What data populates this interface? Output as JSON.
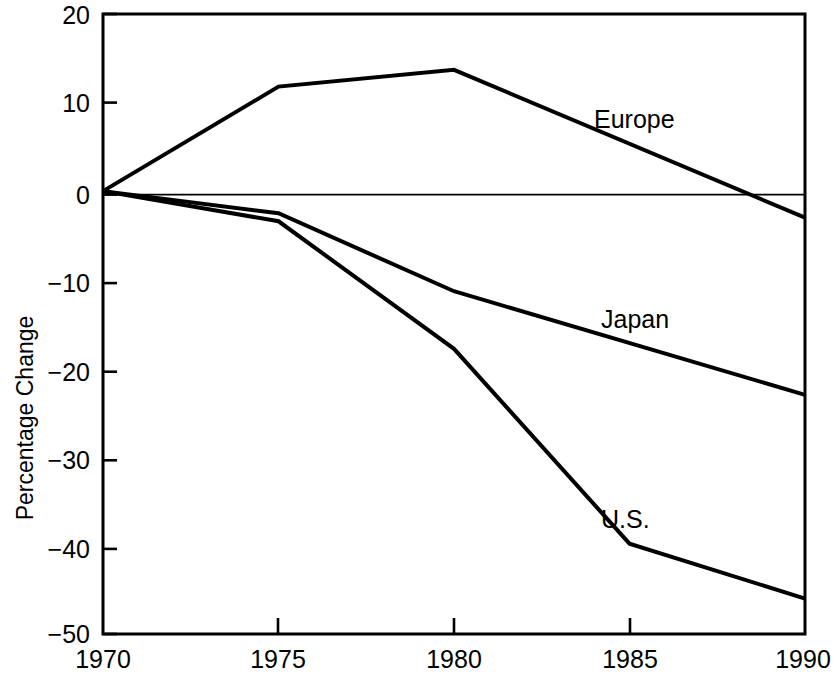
{
  "chart_data": {
    "type": "line",
    "title": "",
    "subtitle": "",
    "xlabel": "",
    "ylabel": "Percentage Change",
    "x": [
      1970,
      1975,
      1980,
      1985,
      1990
    ],
    "xticklabels": [
      "1970",
      "1975",
      "1980",
      "1985",
      "1990"
    ],
    "yticks": [
      20,
      10,
      0,
      -10,
      -20,
      -30,
      -40,
      -50
    ],
    "yticklabels": [
      "20",
      "10",
      "0",
      "−10",
      "−20",
      "−30",
      "−40",
      "−50"
    ],
    "xlim": [
      1970,
      1990
    ],
    "ylim": [
      -50,
      20
    ],
    "grid": false,
    "legend": "inline-labels",
    "zero_reference_line": true,
    "series": [
      {
        "name": "Europe",
        "label": "Europe",
        "color": "#000000",
        "x": [
          1970,
          1975,
          1980,
          1990
        ],
        "values": [
          0,
          11.8,
          13.7,
          -3.0
        ]
      },
      {
        "name": "Japan",
        "label": "Japan",
        "color": "#000000",
        "x": [
          1970,
          1975,
          1980,
          1990
        ],
        "values": [
          0,
          -2.5,
          -11.3,
          -23.0
        ]
      },
      {
        "name": "U.S.",
        "label": "U.S.",
        "color": "#000000",
        "x": [
          1970,
          1975,
          1980,
          1985,
          1990
        ],
        "values": [
          0,
          -3.4,
          -17.8,
          -39.8,
          -46.0
        ]
      }
    ],
    "annotations": [
      {
        "text": "Europe",
        "x": 1987.0,
        "y": 7.5
      },
      {
        "text": "Japan",
        "x": 1987.2,
        "y": -14.0
      },
      {
        "text": "U.S.",
        "x": 1985.2,
        "y": -36.0
      }
    ]
  },
  "axis": {
    "y_title": "Percentage Change",
    "y_tick_20": "20",
    "y_tick_10": "10",
    "y_tick_0": "0",
    "y_tick_m10": "−10",
    "y_tick_m20": "−20",
    "y_tick_m30": "−30",
    "y_tick_m40": "−40",
    "y_tick_m50": "−50",
    "x_tick_1970": "1970",
    "x_tick_1975": "1975",
    "x_tick_1980": "1980",
    "x_tick_1985": "1985",
    "x_tick_1990": "1990"
  },
  "labels": {
    "europe": "Europe",
    "japan": "Japan",
    "us": "U.S."
  },
  "colors": {
    "ink": "#000000",
    "background": "#ffffff"
  }
}
